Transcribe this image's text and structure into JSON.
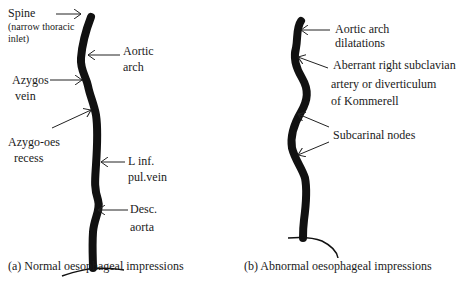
{
  "panel_a": {
    "caption": "(a) Normal oesophageal impressions",
    "labels": {
      "spine": "Spine",
      "spine_note_1": "(narrow thoracic",
      "spine_note_2": "inlet)",
      "aortic_arch_1": "Aortic",
      "aortic_arch_2": "arch",
      "azygos_1": "Azygos",
      "azygos_2": "vein",
      "azygo_oes_1": "Azygo-oes",
      "azygo_oes_2": "recess",
      "l_inf_1": "L inf.",
      "l_inf_2": "pul.vein",
      "desc_1": "Desc.",
      "desc_2": "aorta"
    }
  },
  "panel_b": {
    "caption": "(b) Abnormal oesophageal impressions",
    "labels": {
      "aortic_dil_1": "Aortic arch",
      "aortic_dil_2": "dilatations",
      "aberrant_1": "Aberrant right subclavian",
      "aberrant_2": "artery or diverticulum",
      "aberrant_3": "of Kommerell",
      "subcarinal": "Subcarinal nodes"
    }
  },
  "colors": {
    "ink": "#111111",
    "background": "#ffffff"
  }
}
